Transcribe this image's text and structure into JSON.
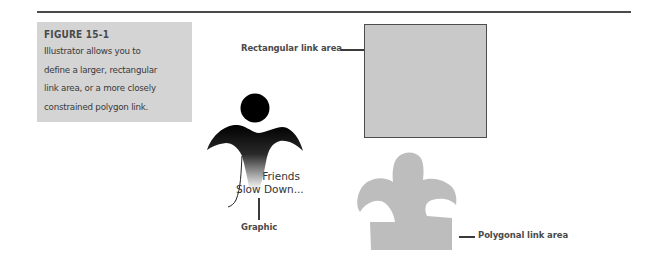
{
  "figure": {
    "title": "FIGURE 15-1",
    "caption": "Illustrator allows you to define a larger, rectangular link area, or a more closely constrained polygon link.",
    "caption_lines": [
      "Illustrator allows you to",
      "define a larger, rectangular",
      "link area, or a more closely",
      "constrained polygon link."
    ]
  },
  "labels": {
    "rectangular": "Rectangular link area",
    "polygonal": "Polygonal link area",
    "graphic": "Graphic"
  },
  "graphic_text": {
    "line1": "Friends",
    "line2": "Slow Down..."
  },
  "colors": {
    "caption_bg": "#d4d4d4",
    "link_area_fill": "#c9c9c9",
    "rule": "#4a4a4a",
    "logo_dark": "#000000"
  }
}
